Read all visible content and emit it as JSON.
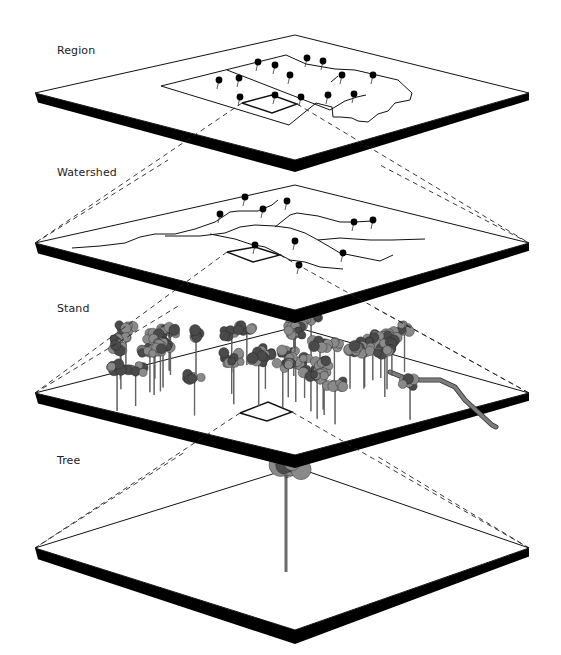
{
  "diagram": {
    "colors": {
      "plate_fill": "#ffffff",
      "plate_edge": "#000000",
      "outline": "#111111",
      "dash": "#222222",
      "canopy": "#8a8a8a",
      "canopy_dark": "#4a4a4a",
      "stream_ribbon": "#7d7d7d"
    },
    "levels": [
      {
        "id": "region",
        "label": "Region",
        "label_pos": [
          57,
          55
        ],
        "plate": {
          "top": [
            295,
            35
          ],
          "left": [
            35,
            93
          ],
          "right": [
            529,
            93
          ],
          "bottom": [
            295,
            160
          ],
          "thickness": 12
        }
      },
      {
        "id": "watershed",
        "label": "Watershed",
        "label_pos": [
          57,
          177
        ],
        "plate": {
          "top": [
            295,
            185
          ],
          "left": [
            35,
            243
          ],
          "right": [
            529,
            243
          ],
          "bottom": [
            295,
            310
          ],
          "thickness": 13
        }
      },
      {
        "id": "stand",
        "label": "Stand",
        "label_pos": [
          57,
          313
        ],
        "plate": {
          "top": [
            295,
            327
          ],
          "left": [
            35,
            393
          ],
          "right": [
            529,
            393
          ],
          "bottom": [
            295,
            455
          ],
          "thickness": 13
        }
      },
      {
        "id": "tree",
        "label": "Tree",
        "label_pos": [
          57,
          465
        ],
        "plate": {
          "top": [
            295,
            467
          ],
          "left": [
            35,
            548
          ],
          "right": [
            529,
            548
          ],
          "bottom": [
            295,
            630
          ],
          "thickness": 14
        }
      }
    ],
    "region_detail": {
      "outline": [
        [
          161,
          86
        ],
        [
          286,
          55
        ],
        [
          306,
          64
        ],
        [
          335,
          69
        ],
        [
          355,
          70
        ],
        [
          398,
          80
        ],
        [
          412,
          93
        ],
        [
          410,
          100
        ],
        [
          395,
          103
        ],
        [
          388,
          111
        ],
        [
          378,
          114
        ],
        [
          368,
          122
        ],
        [
          358,
          121
        ],
        [
          352,
          118
        ],
        [
          340,
          117
        ],
        [
          333,
          117
        ],
        [
          332,
          107
        ],
        [
          316,
          103
        ],
        [
          289,
          125
        ],
        [
          161,
          86
        ]
      ],
      "inner_lines": [
        [
          [
            227,
            70
          ],
          [
            330,
            110
          ]
        ],
        [
          [
            330,
            110
          ],
          [
            345,
            101
          ],
          [
            357,
            97
          ],
          [
            366,
            95
          ]
        ],
        [
          [
            331,
            82
          ],
          [
            338,
            76
          ]
        ]
      ],
      "selected_box": [
        [
          242,
          103
        ],
        [
          272,
          95
        ],
        [
          297,
          104
        ],
        [
          272,
          113
        ],
        [
          242,
          103
        ]
      ],
      "pins": [
        [
          258,
          62
        ],
        [
          275,
          65
        ],
        [
          307,
          58
        ],
        [
          323,
          61
        ],
        [
          219,
          80
        ],
        [
          239,
          78
        ],
        [
          290,
          75
        ],
        [
          342,
          75
        ],
        [
          373,
          75
        ],
        [
          240,
          97
        ],
        [
          275,
          95
        ],
        [
          301,
          97
        ],
        [
          328,
          95
        ],
        [
          354,
          94
        ]
      ]
    },
    "watershed_detail": {
      "streams": [
        [
          [
            72,
            248
          ],
          [
            100,
            246
          ],
          [
            125,
            243
          ],
          [
            140,
            237
          ],
          [
            155,
            234
          ],
          [
            175,
            234
          ],
          [
            195,
            229
          ],
          [
            215,
            222
          ],
          [
            230,
            212
          ],
          [
            238,
            211
          ],
          [
            258,
            211
          ],
          [
            272,
            205
          ],
          [
            278,
            200
          ]
        ],
        [
          [
            165,
            236
          ],
          [
            200,
            236
          ],
          [
            225,
            233
          ],
          [
            240,
            227
          ],
          [
            255,
            225
          ],
          [
            275,
            226
          ],
          [
            290,
            228
          ],
          [
            305,
            233
          ],
          [
            318,
            240
          ],
          [
            340,
            238
          ],
          [
            370,
            240
          ],
          [
            392,
            240
          ],
          [
            425,
            239
          ]
        ],
        [
          [
            210,
            234
          ],
          [
            235,
            239
          ],
          [
            250,
            244
          ],
          [
            265,
            247
          ],
          [
            275,
            252
          ],
          [
            290,
            260
          ],
          [
            305,
            262
          ],
          [
            320,
            267
          ],
          [
            343,
            269
          ]
        ],
        [
          [
            275,
            227
          ],
          [
            290,
            215
          ],
          [
            297,
            213
          ],
          [
            318,
            216
          ],
          [
            340,
            222
          ],
          [
            355,
            222
          ],
          [
            372,
            221
          ]
        ],
        [
          [
            318,
            240
          ],
          [
            330,
            247
          ],
          [
            340,
            253
          ],
          [
            360,
            257
          ],
          [
            380,
            261
          ],
          [
            393,
            255
          ]
        ]
      ],
      "selected_box": [
        [
          227,
          252
        ],
        [
          255,
          247
        ],
        [
          280,
          255
        ],
        [
          253,
          262
        ],
        [
          227,
          252
        ]
      ],
      "pins": [
        [
          245,
          197
        ],
        [
          287,
          201
        ],
        [
          263,
          209
        ],
        [
          220,
          214
        ],
        [
          354,
          222
        ],
        [
          373,
          220
        ],
        [
          255,
          245
        ],
        [
          295,
          241
        ],
        [
          343,
          253
        ],
        [
          299,
          265
        ]
      ]
    },
    "stand_detail": {
      "selected_box": [
        [
          240,
          413
        ],
        [
          268,
          402
        ],
        [
          292,
          412
        ],
        [
          267,
          421
        ],
        [
          240,
          413
        ]
      ],
      "stream_ribbon": [
        [
          390,
          372
        ],
        [
          405,
          378
        ],
        [
          420,
          380
        ],
        [
          440,
          380
        ],
        [
          455,
          387
        ],
        [
          465,
          400
        ],
        [
          478,
          412
        ],
        [
          492,
          425
        ],
        [
          496,
          427
        ]
      ],
      "tree_clusters": [
        {
          "cx": 155,
          "cy": 370,
          "count": 14,
          "spread": [
            45,
            25
          ]
        },
        {
          "cx": 268,
          "cy": 365,
          "count": 14,
          "spread": [
            45,
            25
          ]
        },
        {
          "cx": 365,
          "cy": 378,
          "count": 16,
          "spread": [
            48,
            28
          ]
        }
      ],
      "top_tree": [
        295,
        332
      ]
    },
    "tree_detail": {
      "trunk_base": [
        286,
        572
      ],
      "crown_center": [
        286,
        468
      ]
    },
    "connectors": [
      {
        "from": "region.box",
        "dashed": true,
        "lines": [
          [
            [
              242,
              103
            ],
            [
              35,
              243
            ]
          ],
          [
            [
              297,
              104
            ],
            [
              529,
              243
            ]
          ]
        ]
      },
      {
        "from": "watershed.box",
        "dashed": true,
        "lines": [
          [
            [
              227,
              252
            ],
            [
              35,
              393
            ]
          ],
          [
            [
              280,
              255
            ],
            [
              529,
              393
            ]
          ]
        ]
      },
      {
        "from": "stand.box",
        "dashed": true,
        "lines": [
          [
            [
              240,
              413
            ],
            [
              35,
              548
            ]
          ],
          [
            [
              292,
              412
            ],
            [
              529,
              548
            ]
          ]
        ]
      },
      {
        "from": "region.sides",
        "dashed": true,
        "lines": [
          [
            [
              35,
              243
            ],
            [
              168,
              160
            ]
          ],
          [
            [
              529,
              243
            ],
            [
              380,
              165
            ]
          ]
        ]
      },
      {
        "from": "watershed.sides",
        "dashed": true,
        "lines": [
          [
            [
              35,
              393
            ],
            [
              180,
              305
            ]
          ],
          [
            [
              529,
              393
            ],
            [
              375,
              308
            ]
          ]
        ]
      },
      {
        "from": "stand.sides",
        "dashed": true,
        "lines": [
          [
            [
              35,
              548
            ],
            [
              185,
              452
            ]
          ],
          [
            [
              529,
              548
            ],
            [
              375,
              455
            ]
          ]
        ]
      }
    ]
  }
}
